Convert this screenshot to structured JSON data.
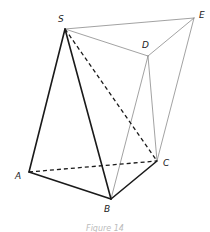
{
  "diagram": {
    "type": "geometry-solid",
    "points": {
      "S": {
        "label": "S",
        "x": 65,
        "y": 29,
        "lx": 58,
        "ly": 22
      },
      "E": {
        "label": "E",
        "x": 194,
        "y": 18,
        "lx": 199,
        "ly": 18
      },
      "D": {
        "label": "D",
        "x": 148,
        "y": 56,
        "lx": 142,
        "ly": 48
      },
      "C": {
        "label": "C",
        "x": 157,
        "y": 161,
        "lx": 163,
        "ly": 166
      },
      "A": {
        "label": "A",
        "x": 29,
        "y": 172,
        "lx": 15,
        "ly": 179
      },
      "B": {
        "label": "B",
        "x": 111,
        "y": 199,
        "lx": 104,
        "ly": 212
      }
    },
    "edges": [
      {
        "from": "S",
        "to": "A",
        "style": "bold"
      },
      {
        "from": "S",
        "to": "B",
        "style": "bold"
      },
      {
        "from": "A",
        "to": "B",
        "style": "bold"
      },
      {
        "from": "B",
        "to": "C",
        "style": "bold"
      },
      {
        "from": "S",
        "to": "C",
        "style": "dashed"
      },
      {
        "from": "A",
        "to": "C",
        "style": "dashed"
      },
      {
        "from": "S",
        "to": "E",
        "style": "thin"
      },
      {
        "from": "S",
        "to": "D",
        "style": "thin"
      },
      {
        "from": "D",
        "to": "E",
        "style": "thin"
      },
      {
        "from": "D",
        "to": "B",
        "style": "thin"
      },
      {
        "from": "D",
        "to": "C",
        "style": "thin"
      },
      {
        "from": "E",
        "to": "C",
        "style": "thin"
      }
    ],
    "caption": "Figure 14",
    "colors": {
      "bold": "#1a1a1a",
      "dashed": "#1a1a1a",
      "thin": "#8a8a8a",
      "caption": "#bbbbbb"
    }
  }
}
